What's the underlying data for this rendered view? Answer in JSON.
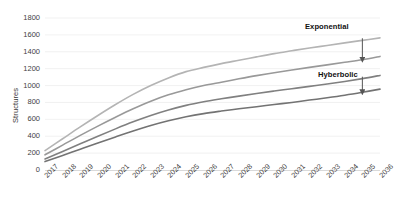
{
  "chart_data": {
    "type": "line",
    "title": "",
    "xlabel": "",
    "ylabel": "Structures",
    "ylim": [
      0,
      1800
    ],
    "ytick_step": 200,
    "yticks": [
      "1800",
      "1600",
      "1400",
      "1200",
      "1000",
      "800",
      "600",
      "400",
      "200",
      "0"
    ],
    "grid": true,
    "grid_axis": "y",
    "legend": "none",
    "categories": [
      "2017",
      "2018",
      "2019",
      "2020",
      "2021",
      "2022",
      "2023",
      "2024",
      "2025",
      "2026",
      "2027",
      "2028",
      "2029",
      "2030",
      "2031",
      "2032",
      "2033",
      "2034",
      "2035",
      "2036"
    ],
    "series": [
      {
        "name": "series-1-top",
        "color": "#b4b4b4",
        "values": [
          230,
          370,
          510,
          645,
          775,
          895,
          1000,
          1090,
          1165,
          1215,
          1260,
          1300,
          1340,
          1378,
          1412,
          1445,
          1475,
          1505,
          1535,
          1565
        ]
      },
      {
        "name": "series-2",
        "color": "#999999",
        "values": [
          180,
          295,
          410,
          520,
          625,
          725,
          815,
          890,
          950,
          1000,
          1040,
          1080,
          1118,
          1152,
          1185,
          1215,
          1245,
          1275,
          1305,
          1345
        ]
      },
      {
        "name": "series-3",
        "color": "#808080",
        "values": [
          130,
          220,
          310,
          400,
          487,
          570,
          645,
          710,
          765,
          808,
          843,
          875,
          905,
          935,
          962,
          990,
          1018,
          1048,
          1082,
          1120
        ]
      },
      {
        "name": "series-4-bottom",
        "color": "#737373",
        "values": [
          100,
          172,
          246,
          320,
          392,
          462,
          527,
          583,
          630,
          668,
          698,
          725,
          750,
          775,
          800,
          828,
          855,
          885,
          920,
          958
        ]
      }
    ],
    "annotations": [
      {
        "name": "exponential",
        "label": "Exponential",
        "arrow": "down",
        "points_to_year": "2035",
        "points_to_value": 1305,
        "from_value": 1560
      },
      {
        "name": "hyberbolic",
        "label": "Hyberbolic",
        "arrow": "down",
        "points_to_year": "2035",
        "points_to_value": 920,
        "from_value": 1105
      }
    ]
  }
}
